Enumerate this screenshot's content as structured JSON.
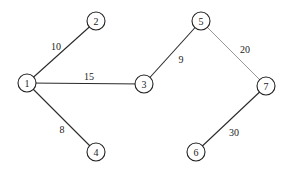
{
  "graph": {
    "nodes": [
      {
        "id": "1",
        "label": "1",
        "x": 27,
        "y": 83
      },
      {
        "id": "2",
        "label": "2",
        "x": 96,
        "y": 21
      },
      {
        "id": "3",
        "label": "3",
        "x": 144,
        "y": 84
      },
      {
        "id": "4",
        "label": "4",
        "x": 96,
        "y": 152
      },
      {
        "id": "5",
        "label": "5",
        "x": 201,
        "y": 21
      },
      {
        "id": "6",
        "label": "6",
        "x": 196,
        "y": 152
      },
      {
        "id": "7",
        "label": "7",
        "x": 266,
        "y": 86
      }
    ],
    "edges": [
      {
        "from": "1",
        "to": "2",
        "weight": "10",
        "label_x": 56,
        "label_y": 46,
        "style": "dark"
      },
      {
        "from": "1",
        "to": "3",
        "weight": "15",
        "label_x": 89,
        "label_y": 76,
        "style": "dark"
      },
      {
        "from": "1",
        "to": "4",
        "weight": "8",
        "label_x": 62,
        "label_y": 129,
        "style": "dark"
      },
      {
        "from": "3",
        "to": "5",
        "weight": "9",
        "label_x": 181,
        "label_y": 59,
        "style": "dark"
      },
      {
        "from": "5",
        "to": "7",
        "weight": "20",
        "label_x": 245,
        "label_y": 49,
        "style": "light"
      },
      {
        "from": "7",
        "to": "6",
        "weight": "30",
        "label_x": 234,
        "label_y": 132,
        "style": "dark"
      }
    ],
    "node_radius": 9
  }
}
